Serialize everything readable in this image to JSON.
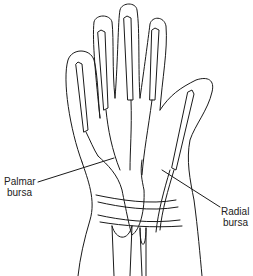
{
  "diagram": {
    "labels": [
      {
        "id": "palmar",
        "line1": "Palmar",
        "line2": "bursa"
      },
      {
        "id": "radial",
        "line1": "Radial",
        "line2": "bursa"
      }
    ]
  }
}
